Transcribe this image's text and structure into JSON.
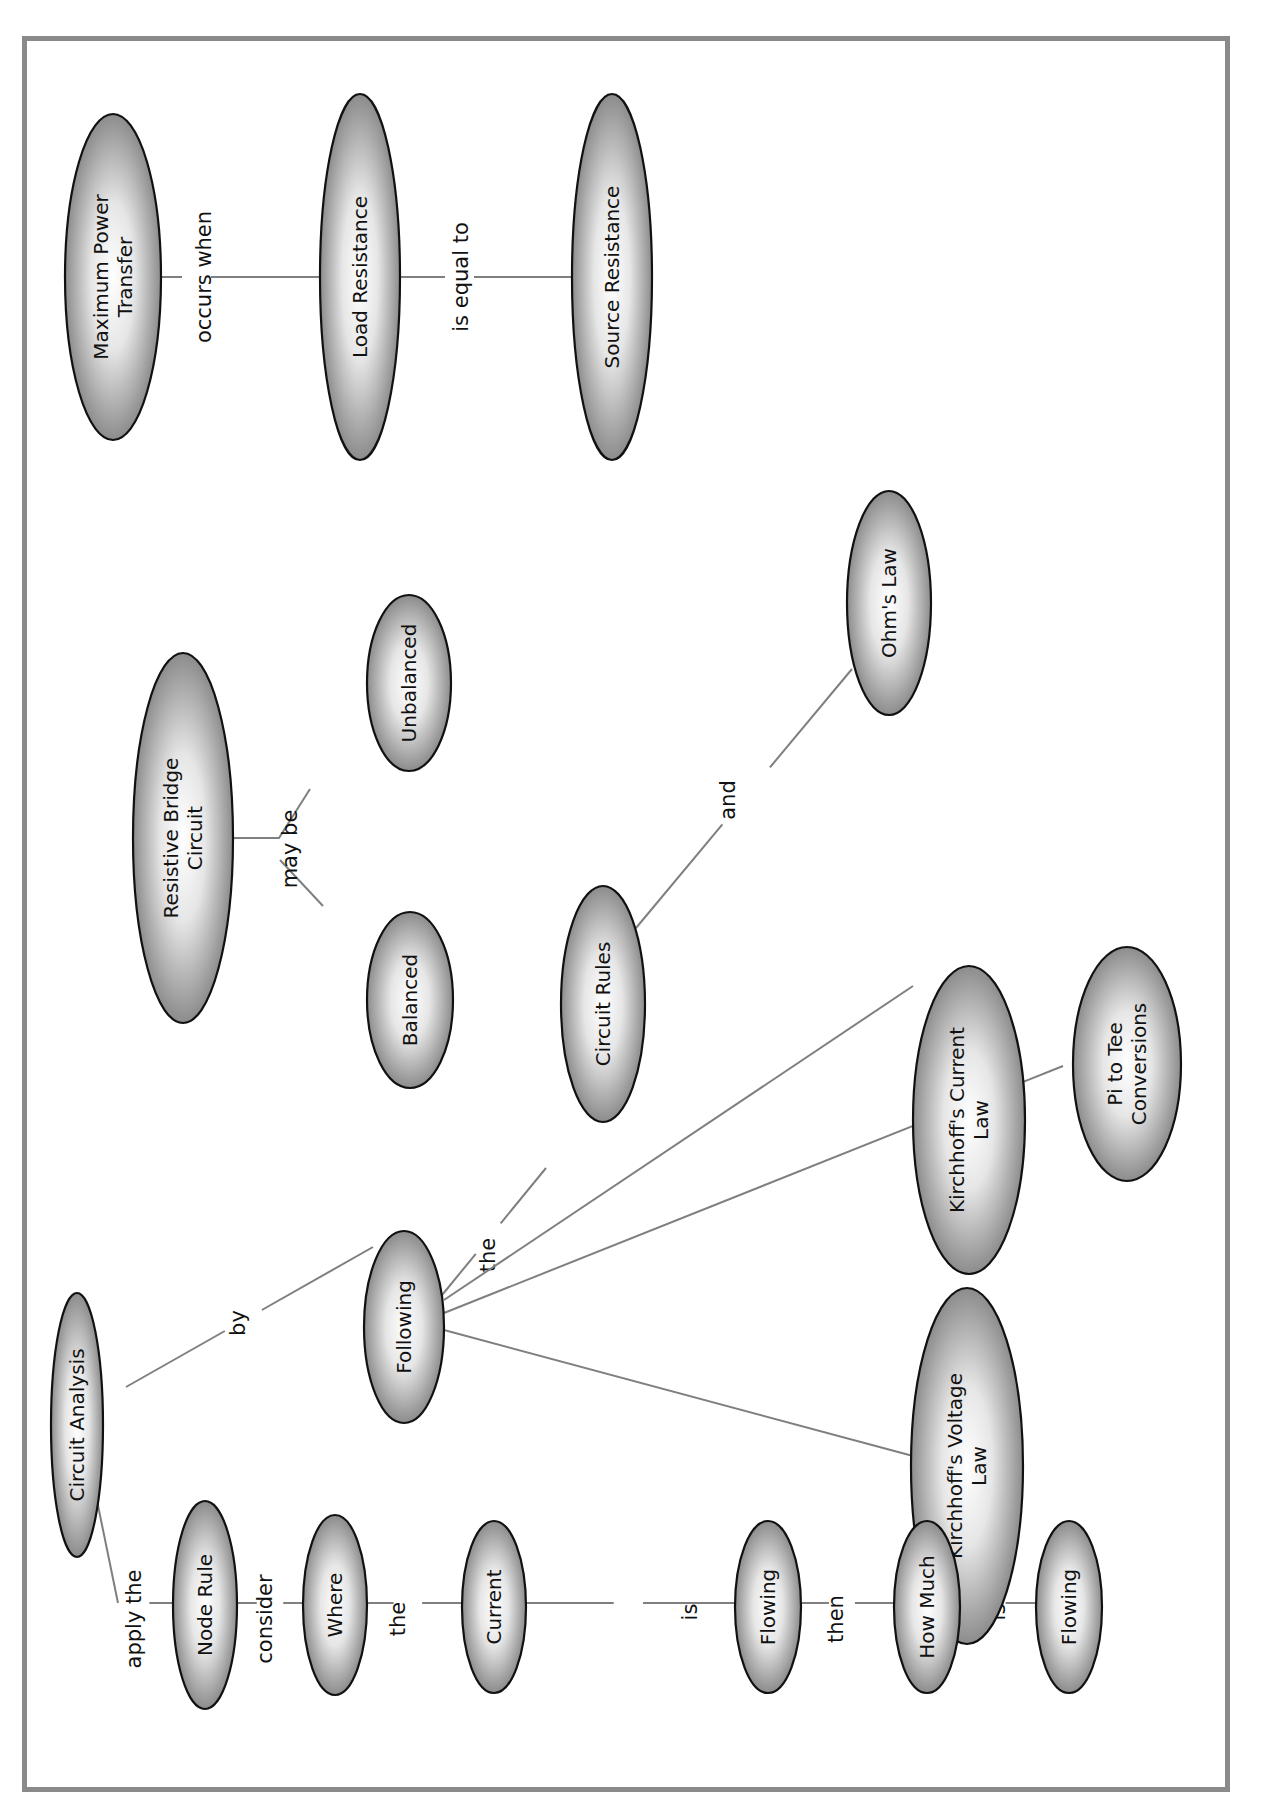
{
  "diagram": {
    "type": "concept-map",
    "orientation": "rotated-90-ccw",
    "colors": {
      "border": "#8a8a8a",
      "connector": "#7f7f7f",
      "node_outline": "#111111",
      "node_fill_center": "#ffffff",
      "node_fill_edge": "#8c8c8c"
    },
    "nodes": [
      {
        "id": "max-power",
        "lines": [
          "Maximum Power",
          "Transfer"
        ]
      },
      {
        "id": "load-res",
        "lines": [
          "Load Resistance"
        ]
      },
      {
        "id": "source-res",
        "lines": [
          "Source Resistance"
        ]
      },
      {
        "id": "bridge",
        "lines": [
          "Resistive Bridge",
          "Circuit"
        ]
      },
      {
        "id": "unbalanced",
        "lines": [
          "Unbalanced"
        ]
      },
      {
        "id": "balanced",
        "lines": [
          "Balanced"
        ]
      },
      {
        "id": "ohms",
        "lines": [
          "Ohm's Law"
        ]
      },
      {
        "id": "circuit-rules",
        "lines": [
          "Circuit Rules"
        ]
      },
      {
        "id": "kcl",
        "lines": [
          "Kirchhoff's Current",
          "Law"
        ]
      },
      {
        "id": "pi-tee",
        "lines": [
          "Pi to Tee",
          "Conversions"
        ]
      },
      {
        "id": "kvl",
        "lines": [
          "Kirchhoff's Voltage",
          "Law"
        ]
      },
      {
        "id": "following",
        "lines": [
          "Following"
        ]
      },
      {
        "id": "circuit-analysis",
        "lines": [
          "Circuit Analysis"
        ]
      },
      {
        "id": "node-rule",
        "lines": [
          "Node Rule"
        ]
      },
      {
        "id": "where",
        "lines": [
          "Where"
        ]
      },
      {
        "id": "current",
        "lines": [
          "Current"
        ]
      },
      {
        "id": "flowing-1",
        "lines": [
          "Flowing"
        ]
      },
      {
        "id": "how-much",
        "lines": [
          "How Much"
        ]
      },
      {
        "id": "flowing-2",
        "lines": [
          "Flowing"
        ]
      }
    ],
    "links": [
      {
        "from": "max-power",
        "to": "load-res",
        "label": "occurs when"
      },
      {
        "from": "load-res",
        "to": "source-res",
        "label": "is equal to"
      },
      {
        "from": "bridge",
        "to": [
          "balanced",
          "unbalanced"
        ],
        "label": "may be"
      },
      {
        "from": "circuit-analysis",
        "to": "following",
        "label": "by"
      },
      {
        "from": "following",
        "to": "circuit-rules",
        "label": "the"
      },
      {
        "from": "circuit-rules",
        "to": "ohms",
        "label": "and"
      },
      {
        "from": "following",
        "to": "kcl",
        "label": ""
      },
      {
        "from": "following",
        "to": "pi-tee",
        "label": ""
      },
      {
        "from": "following",
        "to": "kvl",
        "label": ""
      },
      {
        "from": "circuit-analysis",
        "to": "node-rule",
        "label": "apply the"
      },
      {
        "from": "node-rule",
        "to": "where",
        "label": "consider"
      },
      {
        "from": "where",
        "to": "current",
        "label": "the"
      },
      {
        "from": "current",
        "to": "flowing-1",
        "label": "is"
      },
      {
        "from": "flowing-1",
        "to": "how-much",
        "label": "then"
      },
      {
        "from": "how-much",
        "to": "flowing-2",
        "label": "is"
      }
    ]
  }
}
